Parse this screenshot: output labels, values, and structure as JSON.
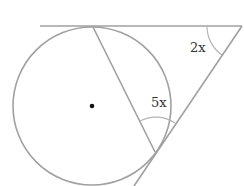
{
  "diagram": {
    "labels": {
      "angle_top_right": "2x",
      "angle_inscribed": "5x"
    },
    "colors": {
      "line": "#a0a0a0",
      "center_dot": "#111111"
    }
  }
}
